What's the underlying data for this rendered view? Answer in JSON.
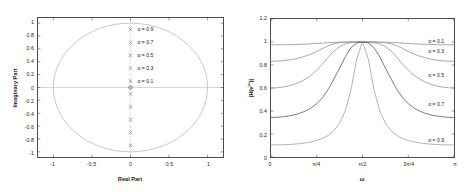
{
  "figure": {
    "background": "#ffffff",
    "frame_color": "#4d4d4d"
  },
  "panels": {
    "left": {
      "name": "pole-zero-plot",
      "xlabel": "Real Part",
      "ylabel": "Imaginary Part",
      "xticks": [
        "-1",
        "-0.5",
        "0",
        "0.5",
        "1"
      ],
      "xtickvals": [
        -1,
        -0.5,
        0,
        0.5,
        1
      ],
      "yticks": [
        "1",
        "0.8",
        "0.6",
        "0.4",
        "0.2",
        "0",
        "-0.2",
        "-0.4",
        "-0.6",
        "-0.8",
        "-1"
      ],
      "ytickvals": [
        1,
        0.8,
        0.6,
        0.4,
        0.2,
        0,
        -0.2,
        -0.4,
        -0.6,
        -0.8,
        -1
      ],
      "xlim": [
        -1.2,
        1.2
      ],
      "ylim": [
        -1.08,
        1.08
      ],
      "annotations": [
        {
          "text": "α = 0.9",
          "x": 0.09,
          "y": 0.9
        },
        {
          "text": "α = 0.7",
          "x": 0.09,
          "y": 0.7
        },
        {
          "text": "α = 0.5",
          "x": 0.09,
          "y": 0.5
        },
        {
          "text": "α = 0.3",
          "x": 0.09,
          "y": 0.3
        },
        {
          "text": "α = 0.1",
          "x": 0.09,
          "y": 0.1
        }
      ]
    },
    "right": {
      "name": "magnitude-response-plot",
      "xlabel": "ω",
      "ylabel": "|H(e^{jω})|",
      "xticks": [
        "0",
        "π/4",
        "π/2",
        "3π/4",
        "π"
      ],
      "xtickvals": [
        0,
        0.25,
        0.5,
        0.75,
        1
      ],
      "yticks": [
        "0",
        "0.2",
        "0.4",
        "0.6",
        "0.8",
        "1",
        "1.2"
      ],
      "ytickvals": [
        0,
        0.2,
        0.4,
        0.6,
        0.8,
        1,
        1.2
      ],
      "xlim": [
        0,
        1
      ],
      "ylim": [
        0,
        1.2
      ],
      "annotations": [
        {
          "text": "α = 0.1",
          "x": 0.855,
          "y": 1.0
        },
        {
          "text": "α = 0.3",
          "x": 0.855,
          "y": 0.915
        },
        {
          "text": "α = 0.5",
          "x": 0.855,
          "y": 0.715
        },
        {
          "text": "α = 0.7",
          "x": 0.855,
          "y": 0.465
        },
        {
          "text": "α = 0.9",
          "x": 0.855,
          "y": 0.155
        }
      ]
    }
  },
  "chart_data": [
    {
      "type": "scatter",
      "name": "pole-zero-plot",
      "title": "",
      "xlabel": "Real Part",
      "ylabel": "Imaginary Part",
      "xlim": [
        -1.2,
        1.2
      ],
      "ylim": [
        -1.08,
        1.08
      ],
      "grid": false,
      "legend": "none",
      "unit_circle": {
        "center": [
          0,
          0
        ],
        "radius": 1,
        "color": "#b0b0b0"
      },
      "zeros": [
        {
          "x": 0,
          "y": 0,
          "marker": "o",
          "multiplicity": 2
        }
      ],
      "poles": [
        {
          "x": 0,
          "y": 0.9,
          "marker": "x",
          "alpha": 0.9
        },
        {
          "x": 0,
          "y": -0.9,
          "marker": "x",
          "alpha": 0.9
        },
        {
          "x": 0,
          "y": 0.7,
          "marker": "x",
          "alpha": 0.7
        },
        {
          "x": 0,
          "y": -0.7,
          "marker": "x",
          "alpha": 0.7
        },
        {
          "x": 0,
          "y": 0.5,
          "marker": "x",
          "alpha": 0.5
        },
        {
          "x": 0,
          "y": -0.5,
          "marker": "x",
          "alpha": 0.5
        },
        {
          "x": 0,
          "y": 0.3,
          "marker": "x",
          "alpha": 0.3
        },
        {
          "x": 0,
          "y": -0.3,
          "marker": "x",
          "alpha": 0.3
        },
        {
          "x": 0,
          "y": 0.1,
          "marker": "x",
          "alpha": 0.1
        },
        {
          "x": 0,
          "y": -0.1,
          "marker": "x",
          "alpha": 0.1
        }
      ],
      "annotations": [
        {
          "text": "α = 0.9",
          "x": 0.09,
          "y": 0.9
        },
        {
          "text": "α = 0.7",
          "x": 0.09,
          "y": 0.7
        },
        {
          "text": "α = 0.5",
          "x": 0.09,
          "y": 0.5
        },
        {
          "text": "α = 0.3",
          "x": 0.09,
          "y": 0.3
        },
        {
          "text": "α = 0.1",
          "x": 0.09,
          "y": 0.1
        }
      ]
    },
    {
      "type": "line",
      "name": "magnitude-response-plot",
      "title": "",
      "xlabel": "ω",
      "ylabel": "|H(e^{jω})|",
      "xlim": [
        0,
        3.14159
      ],
      "ylim": [
        0,
        1.2
      ],
      "grid": false,
      "legend": "inline-annotations",
      "x_tick_labels": [
        "0",
        "π/4",
        "π/2",
        "3π/4",
        "π"
      ],
      "x_tick_values": [
        0,
        0.7854,
        1.5708,
        2.3562,
        3.14159
      ],
      "y_tick_values": [
        0,
        0.2,
        0.4,
        0.6,
        0.8,
        1.0,
        1.2
      ],
      "x_samples": [
        0,
        0.0982,
        0.1963,
        0.2945,
        0.3927,
        0.4909,
        0.589,
        0.6872,
        0.7854,
        0.8836,
        0.9817,
        1.0799,
        1.1781,
        1.2763,
        1.3744,
        1.4726,
        1.5708,
        1.669,
        1.7671,
        1.8653,
        1.9635,
        2.0617,
        2.1598,
        2.258,
        2.3562,
        2.4544,
        2.5525,
        2.6507,
        2.7489,
        2.8471,
        2.9452,
        3.0434,
        3.14159
      ],
      "series": [
        {
          "name": "α = 0.1",
          "alpha": 0.1,
          "color": "#8c8c8c",
          "values": [
            0.9754,
            0.9756,
            0.9761,
            0.977,
            0.9782,
            0.9798,
            0.9818,
            0.9843,
            0.9874,
            0.991,
            0.9941,
            0.9966,
            0.9984,
            0.9995,
            0.9999,
            1.0,
            1.0,
            1.0,
            0.9999,
            0.9995,
            0.9984,
            0.9966,
            0.9941,
            0.991,
            0.9874,
            0.9843,
            0.9818,
            0.9798,
            0.9782,
            0.977,
            0.9761,
            0.9756,
            0.9754
          ]
        },
        {
          "name": "α = 0.3",
          "alpha": 0.3,
          "color": "#8c8c8c",
          "values": [
            0.8321,
            0.8332,
            0.8366,
            0.8425,
            0.851,
            0.8624,
            0.877,
            0.8952,
            0.9177,
            0.9434,
            0.9671,
            0.9843,
            0.9941,
            0.9988,
            0.9999,
            1.0,
            1.0,
            1.0,
            0.9999,
            0.9988,
            0.9941,
            0.9843,
            0.9671,
            0.9434,
            0.9177,
            0.8952,
            0.877,
            0.8624,
            0.851,
            0.8425,
            0.8366,
            0.8332,
            0.8321
          ]
        },
        {
          "name": "α = 0.5",
          "alpha": 0.5,
          "color": "#8c8c8c",
          "values": [
            0.6,
            0.6018,
            0.6074,
            0.617,
            0.6312,
            0.6508,
            0.6769,
            0.7109,
            0.7545,
            0.8081,
            0.8674,
            0.9214,
            0.9601,
            0.9834,
            0.9962,
            1.0,
            1.0,
            1.0,
            0.9962,
            0.9834,
            0.9601,
            0.9214,
            0.8674,
            0.8081,
            0.7545,
            0.7109,
            0.6769,
            0.6508,
            0.6312,
            0.617,
            0.6074,
            0.6018,
            0.6
          ]
        },
        {
          "name": "α = 0.7",
          "alpha": 0.7,
          "color": "#4d4d4d",
          "values": [
            0.3441,
            0.3454,
            0.3492,
            0.3558,
            0.3657,
            0.3797,
            0.3991,
            0.4259,
            0.4633,
            0.5157,
            0.5876,
            0.6784,
            0.7741,
            0.8719,
            0.9519,
            0.9917,
            1.0,
            0.9917,
            0.9519,
            0.8719,
            0.7741,
            0.6784,
            0.5876,
            0.5157,
            0.4633,
            0.4259,
            0.3991,
            0.3797,
            0.3657,
            0.3558,
            0.3492,
            0.3454,
            0.3441
          ]
        },
        {
          "name": "α = 0.9",
          "alpha": 0.9,
          "color": "#999999",
          "values": [
            0.1047,
            0.1051,
            0.1063,
            0.1084,
            0.1116,
            0.1161,
            0.1224,
            0.1311,
            0.1434,
            0.1612,
            0.1876,
            0.2284,
            0.2942,
            0.4038,
            0.5873,
            0.8563,
            1.0,
            0.8563,
            0.5873,
            0.4038,
            0.2942,
            0.2284,
            0.1876,
            0.1612,
            0.1434,
            0.1311,
            0.1224,
            0.1161,
            0.1116,
            0.1084,
            0.1063,
            0.1051,
            0.1047
          ]
        }
      ]
    }
  ]
}
